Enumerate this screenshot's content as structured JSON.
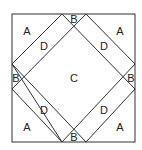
{
  "diagram": {
    "type": "quilt-block-pattern",
    "line_color": "#333333",
    "outer_square": {
      "x": 12,
      "y": 14,
      "size": 123
    },
    "labels": [
      {
        "id": "A-top-left",
        "text": "A",
        "x": 27,
        "y": 35
      },
      {
        "id": "A-top-right",
        "text": "A",
        "x": 120,
        "y": 35
      },
      {
        "id": "A-bottom-left",
        "text": "A",
        "x": 27,
        "y": 131
      },
      {
        "id": "A-bottom-right",
        "text": "A",
        "x": 120,
        "y": 131
      },
      {
        "id": "B-top",
        "text": "B",
        "x": 74,
        "y": 23
      },
      {
        "id": "B-left",
        "text": "B",
        "x": 16,
        "y": 82
      },
      {
        "id": "B-right",
        "text": "B",
        "x": 131,
        "y": 82
      },
      {
        "id": "B-bottom",
        "text": "B",
        "x": 74,
        "y": 141
      },
      {
        "id": "C-center",
        "text": "C",
        "x": 74,
        "y": 82
      },
      {
        "id": "D-top-left",
        "text": "D",
        "x": 44,
        "y": 50
      },
      {
        "id": "D-top-right",
        "text": "D",
        "x": 104,
        "y": 50
      },
      {
        "id": "D-bottom-left",
        "text": "D",
        "x": 44,
        "y": 114
      },
      {
        "id": "D-bottom-right",
        "text": "D",
        "x": 104,
        "y": 114
      }
    ]
  }
}
